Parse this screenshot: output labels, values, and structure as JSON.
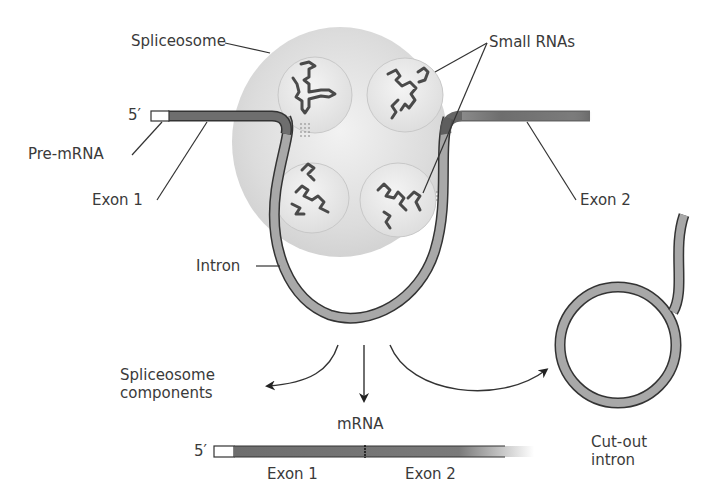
{
  "diagram": {
    "title": "",
    "labels": {
      "spliceosome": "Spliceosome",
      "small_rnas": "Small RNAs",
      "five_prime_top": "5′",
      "pre_mrna": "Pre-mRNA",
      "exon1_top": "Exon 1",
      "exon2_top": "Exon 2",
      "intron": "Intron",
      "spliceosome_components_line1": "Spliceosome",
      "spliceosome_components_line2": "components",
      "mrna": "mRNA",
      "five_prime_bottom": "5′",
      "exon1_bottom": "Exon 1",
      "exon2_bottom": "Exon 2",
      "cut_out_intron_line1": "Cut-out",
      "cut_out_intron_line2": "intron"
    },
    "colors": {
      "spliceosome_fill": "#d9d9d9",
      "subunit_fill": "#e6e6e6",
      "exon_fill": "#6e6e6e",
      "intron_fill": "#a8a8a8",
      "outline": "#333333",
      "cap_fill": "#ffffff"
    }
  }
}
